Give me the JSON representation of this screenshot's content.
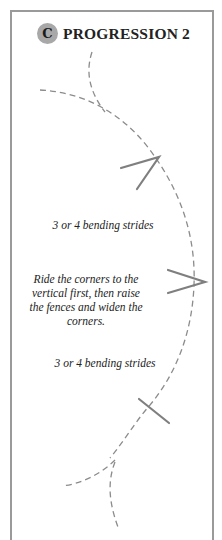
{
  "header": {
    "badge": "C",
    "title": "PROGRESSION 2"
  },
  "labels": {
    "strides_top": "3 or 4 bending strides",
    "instruction": "Ride the corners to the vertical first, then raise the fences and widen the corners.",
    "strides_bottom": "3 or 4 bending strides"
  },
  "colors": {
    "frame": "#9a9a9a",
    "badge": "#a8a8a8",
    "path": "#8c8c8c",
    "fence": "#7f7f7f"
  }
}
